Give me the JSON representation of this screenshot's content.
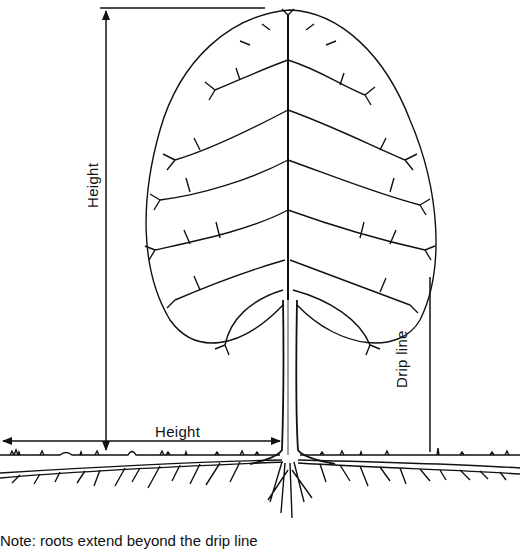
{
  "diagram": {
    "labels": {
      "vertical_height": "Height",
      "horizontal_height": "Height",
      "drip_line": "Drip line"
    },
    "caption": "Note: roots extend beyond the drip line",
    "elements": [
      {
        "name": "tree-crown",
        "description": "Oval deciduous tree crown with branching limbs"
      },
      {
        "name": "tree-trunk",
        "description": "Single vertical trunk"
      },
      {
        "name": "ground-line",
        "description": "Soil surface with grass tufts"
      },
      {
        "name": "root-system",
        "description": "Lateral roots spreading horizontally below ground"
      },
      {
        "name": "height-dimension-vertical",
        "description": "Arrow from ground to tree top"
      },
      {
        "name": "height-dimension-horizontal",
        "description": "Arrow from trunk extending outward the same distance as height"
      },
      {
        "name": "drip-line-marker",
        "description": "Vertical line at outer edge of crown"
      }
    ],
    "colors": {
      "ink": "#111111",
      "background": "#ffffff"
    }
  }
}
